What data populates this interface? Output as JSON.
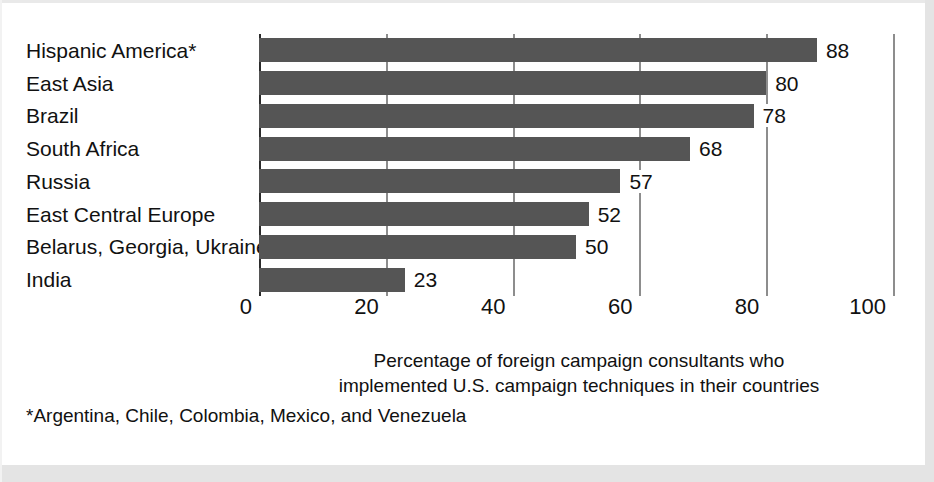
{
  "chart_data": {
    "type": "bar",
    "orientation": "horizontal",
    "title": "",
    "categories": [
      "Hispanic America*",
      "East Asia",
      "Brazil",
      "South Africa",
      "Russia",
      "East Central Europe",
      "Belarus, Georgia, Ukraine",
      "India"
    ],
    "values": [
      88,
      80,
      78,
      68,
      57,
      52,
      50,
      23
    ],
    "value_labels": [
      "88",
      "80",
      "78",
      "68",
      "57",
      "52",
      "50",
      "23"
    ],
    "xlabel": "Percentage of foreign campaign consultants who implemented U.S. campaign techniques in their countries",
    "ylabel": "",
    "xlim": [
      0,
      100
    ],
    "xticks": [
      0,
      20,
      40,
      60,
      80,
      100
    ],
    "xtick_labels": [
      "0",
      "20",
      "40",
      "60",
      "80",
      "100"
    ],
    "grid": true,
    "grid_axis": "x",
    "legend": "none",
    "bar_color": "#555555",
    "axis_color": "#2b2b2b",
    "gridline_color": "#8d8d8d",
    "text_color": "#111111",
    "background": "#ffffff"
  },
  "caption": {
    "line1": "Percentage of foreign campaign consultants who",
    "line2": "implemented U.S. campaign techniques in their countries"
  },
  "footnote": {
    "text": "*Argentina, Chile, Colombia, Mexico, and Venezuela"
  }
}
